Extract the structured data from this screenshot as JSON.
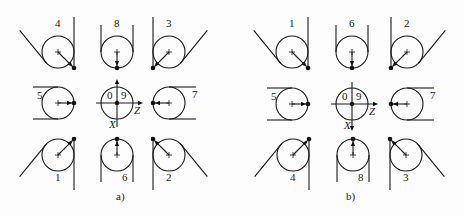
{
  "figure": {
    "panels": [
      {
        "id": "a",
        "caption": "a)",
        "caption_pos": [
          116,
          200
        ],
        "center": {
          "cx": 117,
          "cy": 103,
          "label_left": "0",
          "label_right": "9",
          "axis_z": "Z",
          "axis_x": "X",
          "x_arrow": "up"
        },
        "positions": [
          {
            "label": "4",
            "cx": 58,
            "cy": 52,
            "type": "corner",
            "dir": "br"
          },
          {
            "label": "8",
            "cx": 117,
            "cy": 52,
            "type": "edge",
            "dir": "b"
          },
          {
            "label": "3",
            "cx": 169,
            "cy": 52,
            "type": "corner",
            "dir": "bl"
          },
          {
            "label": "5",
            "cx": 58,
            "cy": 103,
            "type": "edge",
            "dir": "r"
          },
          {
            "label": "7",
            "cx": 169,
            "cy": 103,
            "type": "edge",
            "dir": "l"
          },
          {
            "label": "1",
            "cx": 58,
            "cy": 155,
            "type": "corner",
            "dir": "tr"
          },
          {
            "label": "6",
            "cx": 117,
            "cy": 155,
            "type": "edge",
            "dir": "t"
          },
          {
            "label": "2",
            "cx": 169,
            "cy": 155,
            "type": "corner",
            "dir": "tl"
          }
        ]
      },
      {
        "id": "b",
        "caption": "b)",
        "caption_pos": [
          346,
          200
        ],
        "center": {
          "cx": 352,
          "cy": 104,
          "label_left": "0",
          "label_right": "9",
          "axis_z": "Z",
          "axis_x": "X",
          "x_arrow": "down"
        },
        "positions": [
          {
            "label": "1",
            "cx": 292,
            "cy": 52,
            "type": "corner",
            "dir": "br"
          },
          {
            "label": "6",
            "cx": 352,
            "cy": 52,
            "type": "edge",
            "dir": "b"
          },
          {
            "label": "2",
            "cx": 407,
            "cy": 52,
            "type": "corner",
            "dir": "bl"
          },
          {
            "label": "5",
            "cx": 292,
            "cy": 104,
            "type": "edge",
            "dir": "r"
          },
          {
            "label": "7",
            "cx": 407,
            "cy": 104,
            "type": "edge",
            "dir": "l"
          },
          {
            "label": "4",
            "cx": 293,
            "cy": 155,
            "type": "corner",
            "dir": "tr"
          },
          {
            "label": "8",
            "cx": 353,
            "cy": 155,
            "type": "edge",
            "dir": "t"
          },
          {
            "label": "3",
            "cx": 406,
            "cy": 155,
            "type": "corner",
            "dir": "tl"
          }
        ]
      }
    ],
    "radius": 16
  }
}
